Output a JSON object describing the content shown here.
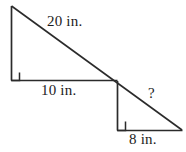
{
  "figure": {
    "type": "geometry-diagram",
    "stroke_color": "#2b2b2b",
    "background_color": "#ffffff",
    "labels": {
      "hypotenuse_large": "20 in.",
      "base_large": "10 in.",
      "base_small": "8 in.",
      "unknown_side": "?"
    },
    "shapes": {
      "large_triangle": {
        "apex": [
          11,
          6
        ],
        "right_angle_vertex": [
          11,
          80
        ],
        "base_end": [
          117,
          80
        ],
        "right_angle_marker": true
      },
      "small_triangle": {
        "top_vertex": [
          117,
          81
        ],
        "right_angle_vertex": [
          117,
          130
        ],
        "base_end": [
          182,
          130
        ],
        "right_angle_marker": true
      },
      "hypotenuse_line": {
        "start": [
          11,
          6
        ],
        "end": [
          182,
          130
        ]
      }
    }
  }
}
